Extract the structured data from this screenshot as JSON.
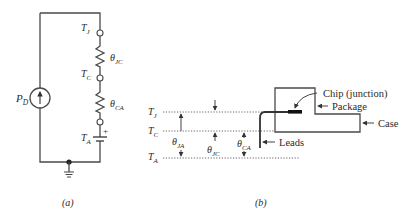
{
  "figure_a": {
    "caption": "(a)",
    "source": {
      "label": "P",
      "sub": "D"
    },
    "nodes": [
      {
        "label": "T",
        "sub": "J"
      },
      {
        "label": "T",
        "sub": "C"
      },
      {
        "label": "T",
        "sub": "A"
      }
    ],
    "resistors": [
      {
        "label": "θ",
        "sub": "JC"
      },
      {
        "label": "θ",
        "sub": "CA"
      }
    ],
    "battery_polarity": "+"
  },
  "figure_b": {
    "caption": "(b)",
    "levels": [
      {
        "label": "T",
        "sub": "J"
      },
      {
        "label": "T",
        "sub": "C"
      },
      {
        "label": "T",
        "sub": "A"
      }
    ],
    "dimensions": [
      {
        "label": "θ",
        "sub": "JA"
      },
      {
        "label": "θ",
        "sub": "JC"
      },
      {
        "label": "θ",
        "sub": "CA"
      }
    ],
    "callouts": {
      "chip": "Chip (junction)",
      "package": "Package",
      "case": "Case",
      "leads": "Leads"
    }
  }
}
